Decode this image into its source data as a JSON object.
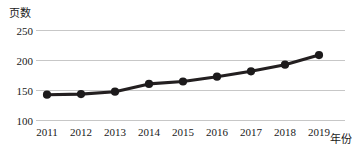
{
  "chart_data": {
    "type": "line",
    "title": "",
    "subtitle": "",
    "xlabel": "年份",
    "ylabel": "页数",
    "categories": [
      "2011",
      "2012",
      "2013",
      "2014",
      "2015",
      "2016",
      "2017",
      "2018",
      "2019"
    ],
    "values": [
      143,
      144,
      148,
      161,
      165,
      173,
      182,
      193,
      209
    ],
    "series": [
      {
        "name": "页数",
        "values": [
          143,
          144,
          148,
          161,
          165,
          173,
          182,
          193,
          209
        ]
      }
    ],
    "yticks": [
      100,
      150,
      200,
      250
    ],
    "ytick_labels": [
      "100",
      "150",
      "200",
      "250"
    ],
    "xtick_labels": [
      "2011",
      "2012",
      "2013",
      "2014",
      "2015",
      "2016",
      "2017",
      "2018",
      "2019"
    ],
    "ylim": [
      100,
      250
    ],
    "grid": "horizontal",
    "legend": "none",
    "line_color": "#231f20",
    "marker_color": "#1c1a1b",
    "grid_color": "#b9b9b9",
    "background_color": "#ffffff",
    "marker": "circle"
  }
}
